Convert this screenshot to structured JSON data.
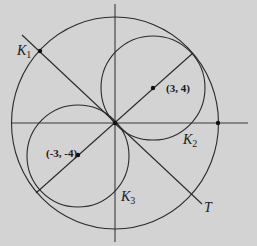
{
  "diagram": {
    "colors": {
      "background": "#d3d3d3",
      "stroke": "#2a2a2a"
    },
    "labels": {
      "k1": {
        "main": "K",
        "sub": "1"
      },
      "k2": {
        "main": "K",
        "sub": "2"
      },
      "k3": {
        "main": "K",
        "sub": "3"
      },
      "t": "T"
    },
    "points": {
      "p1": "(3, 4)",
      "p2": "(-3, -4)"
    },
    "circles": [
      {
        "name": "K1",
        "center": [
          0,
          0
        ],
        "note": "large outer circle"
      },
      {
        "name": "K2",
        "center": [
          3,
          4
        ],
        "radius": 5
      },
      {
        "name": "K3",
        "center": [
          -3,
          -4
        ],
        "radius": 5
      }
    ],
    "lines": [
      {
        "name": "T",
        "note": "tangent line through origin perpendicular to line through centers"
      },
      {
        "name": "diameter-line",
        "note": "line through (-3,-4), origin, (3,4)"
      }
    ]
  }
}
